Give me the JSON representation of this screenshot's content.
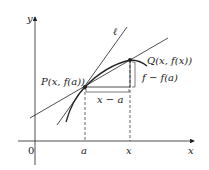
{
  "diagram": {
    "axes": {
      "x_label": "x",
      "y_label": "y",
      "origin_label": "0"
    },
    "tangent_label": "ℓ",
    "point_p": {
      "label": "P(x, f(a))"
    },
    "point_q": {
      "label": "Q(x, f(x))"
    },
    "rise_label": "f − f(a)",
    "run_label": "x − a",
    "x_ticks": [
      "a",
      "x"
    ],
    "colors": {
      "stroke": "#222222",
      "background": "#ffffff"
    }
  }
}
